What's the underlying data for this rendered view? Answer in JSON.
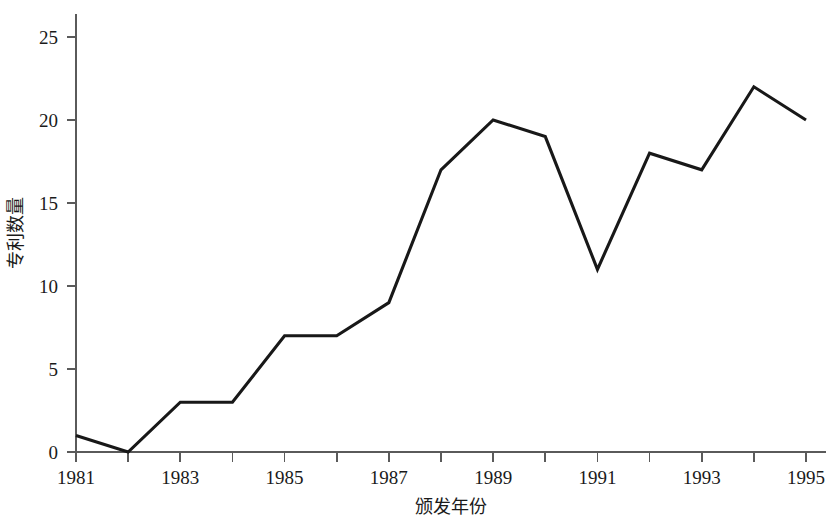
{
  "chart_data": {
    "type": "line",
    "title": "",
    "xlabel": "颁发年份",
    "ylabel": "专利数量",
    "x": [
      1981,
      1982,
      1983,
      1984,
      1985,
      1986,
      1987,
      1988,
      1989,
      1990,
      1991,
      1992,
      1993,
      1994,
      1995
    ],
    "values": [
      1,
      0,
      3,
      3,
      7,
      7,
      9,
      17,
      20,
      19,
      11,
      18,
      17,
      22,
      20
    ],
    "series": [
      {
        "name": "专利数量",
        "values": [
          1,
          0,
          3,
          3,
          7,
          7,
          9,
          17,
          20,
          19,
          11,
          18,
          17,
          22,
          20
        ]
      }
    ],
    "xlim": [
      1981,
      1995
    ],
    "ylim": [
      0,
      27
    ],
    "x_tick_values": [
      1981,
      1982,
      1983,
      1984,
      1985,
      1986,
      1987,
      1988,
      1989,
      1990,
      1991,
      1992,
      1993,
      1994,
      1995
    ],
    "x_tick_labels": [
      "1981",
      "",
      "1983",
      "",
      "1985",
      "",
      "1987",
      "",
      "1989",
      "",
      "1991",
      "",
      "1993",
      "",
      "1995"
    ],
    "y_tick_values": [
      0,
      5,
      10,
      15,
      20,
      25
    ],
    "y_tick_labels": [
      "0",
      "5",
      "10",
      "15",
      "20",
      "25"
    ],
    "grid": false,
    "legend": false,
    "legend_position": "none",
    "line_color": "#181818",
    "axis_color": "#5a5a5a",
    "background_color": "#ffffff"
  },
  "axis_titles": {
    "x": "颁发年份",
    "y": "专利数量"
  }
}
